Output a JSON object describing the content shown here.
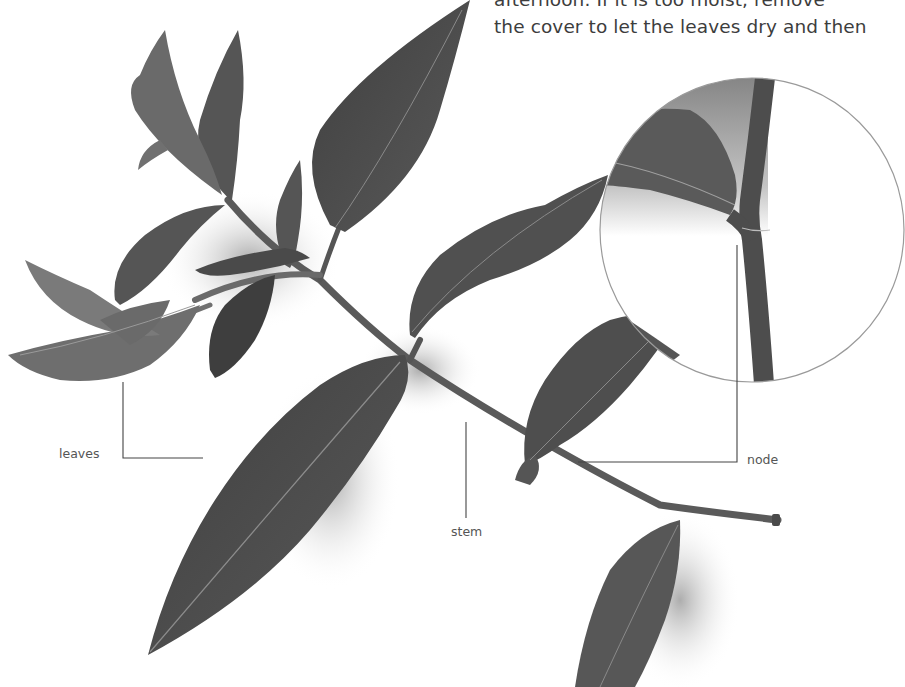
{
  "page": {
    "type": "book-page-illustration",
    "background": "#ffffff"
  },
  "body_text": {
    "lines": [
      "afternoon. If it is too moist, remove",
      "the cover to let the leaves dry and then"
    ],
    "color": "#3d3d3d"
  },
  "figure": {
    "leaf_color": "#4a4a4a",
    "stem_color": "#555555",
    "magnifier": {
      "shape": "circle",
      "center_x": 752,
      "center_y": 230,
      "radius": 152,
      "border_color": "#9a9a9a"
    },
    "labels": [
      {
        "id": "leaves",
        "text": "leaves"
      },
      {
        "id": "stem",
        "text": "stem"
      },
      {
        "id": "node",
        "text": "node"
      }
    ],
    "callout_line_color": "#444444"
  }
}
